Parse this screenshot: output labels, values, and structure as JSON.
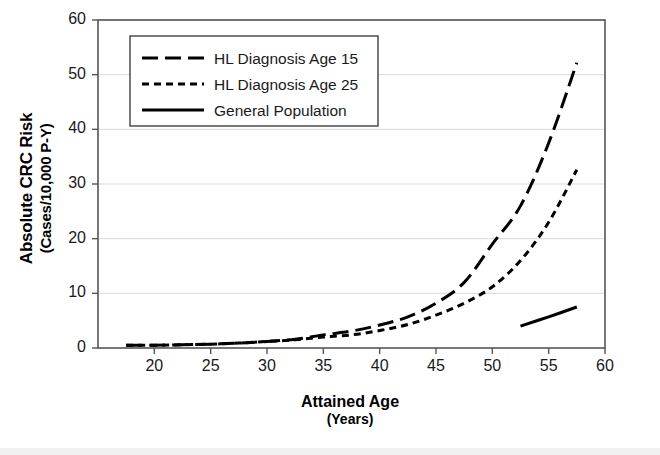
{
  "figure": {
    "background": "#ffffff",
    "frame_color": "#555555",
    "grid_color": "#d9d9d9",
    "line_color": "#000000"
  },
  "labels": {
    "ylabel_line1": "Absolute CRC Risk",
    "ylabel_line2": "(Cases/10,000 P-Y)",
    "xlabel_line1": "Attained Age",
    "xlabel_line2": "(Years)"
  },
  "chart_data": {
    "type": "line",
    "title": "",
    "xlabel": "Attained Age (Years)",
    "ylabel": "Absolute CRC Risk (Cases/10,000 P-Y)",
    "xlim": [
      15,
      60
    ],
    "ylim": [
      0,
      60
    ],
    "xticks": [
      20,
      25,
      30,
      35,
      40,
      45,
      50,
      55,
      60
    ],
    "xticklabels": [
      "20",
      "25",
      "30",
      "35",
      "40",
      "45",
      "50",
      "55",
      "60"
    ],
    "yticks": [
      0,
      10,
      20,
      30,
      40,
      50,
      60
    ],
    "yticklabels": [
      "0",
      "10",
      "20",
      "30",
      "40",
      "50",
      "60"
    ],
    "grid": "horizontal",
    "legend_position": "upper-left-inside",
    "series": [
      {
        "name": "HL Diagnosis Age 15",
        "style": "long-dash",
        "x": [
          17.5,
          20,
          22.5,
          25,
          27.5,
          30,
          32.5,
          35,
          37.5,
          40,
          42.5,
          45,
          47.5,
          50,
          52.5,
          55,
          57.5
        ],
        "values": [
          0.5,
          0.5,
          0.6,
          0.7,
          0.9,
          1.2,
          1.6,
          2.4,
          3.1,
          4.2,
          5.7,
          8.2,
          12.0,
          19.0,
          26.0,
          37.5,
          52.2
        ]
      },
      {
        "name": "HL Diagnosis Age 25",
        "style": "short-dash",
        "x": [
          17.5,
          20,
          22.5,
          25,
          27.5,
          30,
          32.5,
          35,
          37.5,
          40,
          42.5,
          45,
          47.5,
          50,
          52.5,
          55,
          57.5
        ],
        "values": [
          0.5,
          0.5,
          0.6,
          0.7,
          0.9,
          1.2,
          1.5,
          2.0,
          2.4,
          3.2,
          4.3,
          6.0,
          8.2,
          11.2,
          16.0,
          23.0,
          32.6
        ]
      },
      {
        "name": "General Population",
        "style": "solid",
        "x": [
          52.5,
          55,
          57.5
        ],
        "values": [
          4.0,
          5.7,
          7.5
        ]
      }
    ],
    "legend": [
      {
        "label": "HL Diagnosis Age 15",
        "style": "long-dash"
      },
      {
        "label": "HL Diagnosis Age 25",
        "style": "short-dash"
      },
      {
        "label": "General Population",
        "style": "solid"
      }
    ]
  }
}
